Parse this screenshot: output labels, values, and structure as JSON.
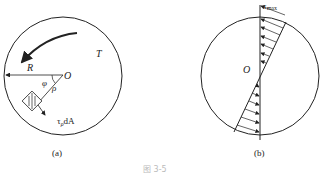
{
  "figure_a": {
    "caption": "(a)",
    "torque_label": "T",
    "radius_label": "R",
    "center_label": "O",
    "angle_label": "φ",
    "rho_label": "ρ",
    "force_label_main": "τ",
    "force_label_sub": "ρ",
    "force_label_tail": "dA"
  },
  "figure_b": {
    "caption": "(b)",
    "center_label": "O",
    "max_label_main": "τ",
    "max_label_sub": "max"
  },
  "figure_caption": "图 3-5",
  "colors": {
    "stroke": "#222222",
    "caption": "#bbbbbb"
  }
}
